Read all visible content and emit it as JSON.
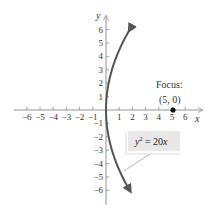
{
  "chart_data": {
    "type": "line",
    "title": "",
    "xlabel": "x",
    "ylabel": "y",
    "xlim": [
      -6.5,
      6.5
    ],
    "ylim": [
      -6.5,
      6.5
    ],
    "grid": false,
    "x_ticks": [
      -6,
      -5,
      -4,
      -3,
      -2,
      -1,
      1,
      2,
      3,
      4,
      5,
      6
    ],
    "x_tick_labels": [
      "−6",
      "−5",
      "−4",
      "−3",
      "−2",
      "−1",
      "1",
      "2",
      "3",
      "4",
      "5",
      "6"
    ],
    "y_ticks": [
      6,
      5,
      4,
      3,
      2,
      1,
      -1,
      -2,
      -3,
      -4,
      -5,
      -6
    ],
    "y_tick_labels": [
      "6",
      "5",
      "4",
      "3",
      "2",
      "1",
      "−1",
      "−2",
      "−3",
      "−4",
      "−5",
      "−6"
    ],
    "series": [
      {
        "name": "y^2 = 20x",
        "equation": "y^2 = 20x",
        "x": [
          1.8,
          1.25,
          0.8,
          0.45,
          0.2,
          0.05,
          0,
          0.05,
          0.2,
          0.45,
          0.8,
          1.25,
          1.8
        ],
        "y": [
          6,
          5,
          4,
          3,
          2,
          1,
          0,
          -1,
          -2,
          -3,
          -4,
          -5,
          -6
        ],
        "color": "#555555",
        "arrows": "both-ends"
      }
    ],
    "points": [
      {
        "label": "Focus:",
        "coords_label": "(5, 0)",
        "x": 5,
        "y": 0,
        "color": "#111111"
      }
    ],
    "annotations": [
      {
        "text": "y² = 20x",
        "box_color": "#e8e8e8",
        "pointer_to": "lower branch of curve"
      }
    ]
  },
  "labels": {
    "x_axis": "x",
    "y_axis": "y",
    "focus_title": "Focus:",
    "focus_coords": "(5, 0)",
    "equation_base": "y",
    "equation_exp": "2",
    "equation_rest": " = 20",
    "equation_var": "x"
  }
}
